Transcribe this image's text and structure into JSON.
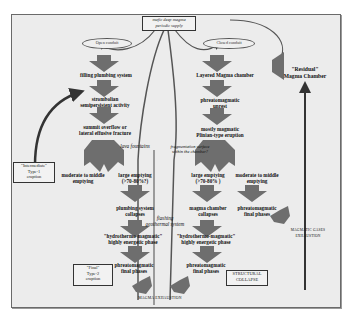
{
  "top_box": {
    "line1": "mafic deep magma",
    "line2": "periodic supply"
  },
  "left_branch": {
    "start": "Open conduit",
    "steps": [
      "filling plumbing system",
      "strombolian",
      "semipersistent activity",
      "summit overflow or",
      "lateral effusive fracture",
      "lava fountains",
      "moderate to middle",
      "emptying",
      "large emptying",
      "(>70-80%?)",
      "plumbing system",
      "collapses",
      "\"hydrothermo-magmatic\"",
      "highly energetic phase",
      "phreatomagmatic",
      "final phases"
    ]
  },
  "right_branch": {
    "start": "Closed conduit",
    "steps": [
      "Layered Magma chamber",
      "phreatomagmatic",
      "unrest",
      "mostly magmatic",
      "Plinian-type eruption",
      "fragmentation surface",
      "within the chamber?",
      "large emptying",
      "(>70-80% )",
      "moderate to middle",
      "emptying",
      "magma chamber",
      "collapses",
      "phreatomagmatic",
      "final phases",
      "\"hydrothermo-magmatic\"",
      "highly energetic phase",
      "phreatomagmatic",
      "final phases"
    ]
  },
  "center": {
    "flashing_line1": "flashing",
    "flashing_line2": "geothermal system",
    "exhaustion": "MAGMA EXHAUSTION"
  },
  "residual": {
    "line1": "\"Residual\"",
    "line2": "Magma Chamber"
  },
  "gases": {
    "line1": "MAGMATIC GASES",
    "line2": "EXHAUSTION"
  },
  "type1_box": {
    "line1": "\"Intermediate\"",
    "line2": "Type-1",
    "line3": "eruption"
  },
  "type2_box": {
    "line1": "\"Final\"",
    "line2": "Type-2",
    "line3": "eruption"
  },
  "collapse_box": {
    "line1": "STRUCTURAL",
    "line2": "COLLAPSE"
  },
  "colors": {
    "background": "#ececec",
    "arrow_fill": "#6e6e6e",
    "frame": "#6a6a6a"
  }
}
